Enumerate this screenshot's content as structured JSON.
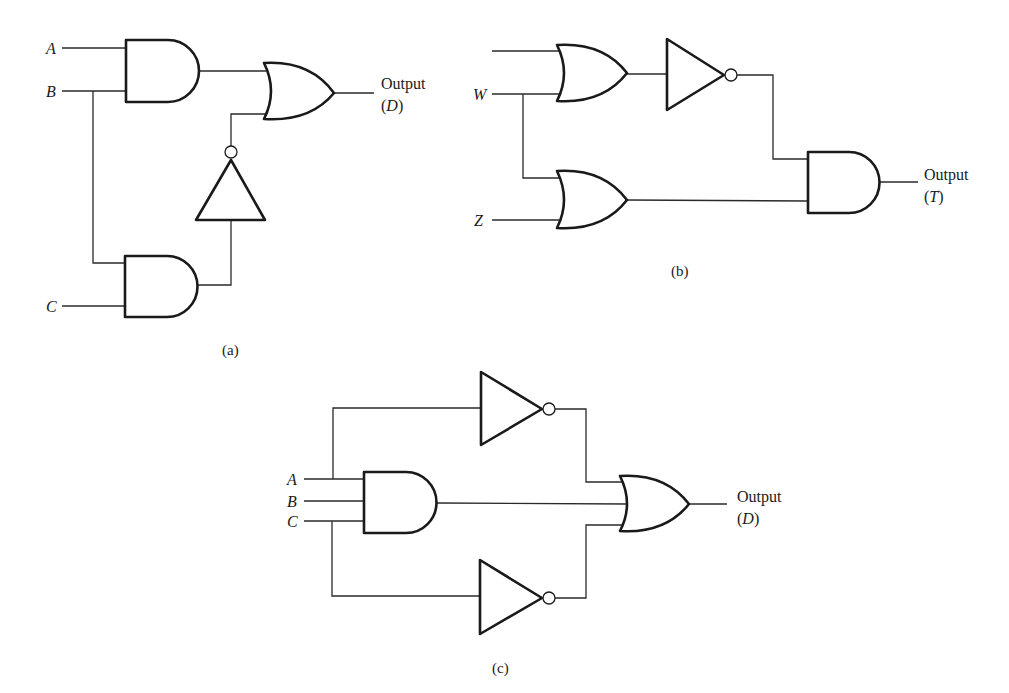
{
  "figure": {
    "panels": [
      {
        "id": "a",
        "caption": "(a)",
        "inputs": [
          "A",
          "B",
          "C"
        ],
        "output": {
          "label": "Output",
          "symbol_open": "(",
          "symbol": "D",
          "symbol_close": ")"
        },
        "gates": [
          "AND (A,B)",
          "AND (B,C)",
          "NOT (AND B,C)",
          "OR"
        ]
      },
      {
        "id": "b",
        "caption": "(b)",
        "inputs": [
          "",
          "W",
          "Z"
        ],
        "output": {
          "label": "Output",
          "symbol_open": "(",
          "symbol": "T",
          "symbol_close": ")"
        },
        "gates": [
          "OR (unlabeled, W)",
          "NOT",
          "OR (W,Z)",
          "AND"
        ]
      },
      {
        "id": "c",
        "caption": "(c)",
        "inputs": [
          "A",
          "B",
          "C"
        ],
        "output": {
          "label": "Output",
          "symbol_open": "(",
          "symbol": "D",
          "symbol_close": ")"
        },
        "gates": [
          "NOT (A)",
          "AND (A,B,C)",
          "NOT (C)",
          "OR"
        ]
      }
    ]
  }
}
